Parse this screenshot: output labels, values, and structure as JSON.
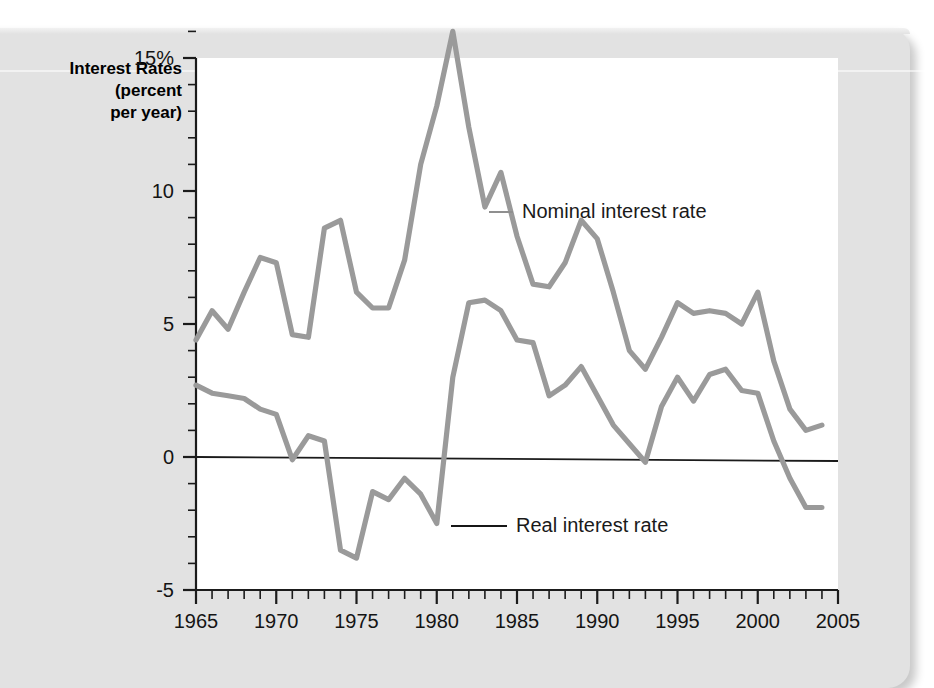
{
  "axis_title": "Interest Rates\n(percent\nper year)",
  "legend": {
    "nominal": "Nominal interest rate",
    "real": "Real interest rate"
  },
  "colors": {
    "series": "#9a9a9a",
    "axis": "#1b1b1b",
    "page": "#e2e2e2",
    "plot_background": "#ffffff"
  },
  "chart_data": {
    "type": "line",
    "title": "Interest Rates (percent per year)",
    "xlabel": "",
    "ylabel": "Interest Rates (percent per year)",
    "xlim": [
      1965,
      2005
    ],
    "ylim": [
      -5,
      16.5
    ],
    "grid": false,
    "legend_position": "inline-annotation",
    "x_tick_labels": [
      "1965",
      "1970",
      "1975",
      "1980",
      "1985",
      "1990",
      "1995",
      "2000",
      "2005"
    ],
    "x_major_ticks": [
      1965,
      1970,
      1975,
      1980,
      1985,
      1990,
      1995,
      2000,
      2005
    ],
    "x_minor_step": 1,
    "y_tick_labels": [
      "15%",
      "10",
      "5",
      "0",
      "-5"
    ],
    "y_major_ticks": [
      15,
      10,
      5,
      0,
      -5
    ],
    "y_minor_step": 1,
    "zero_line": 0,
    "x": [
      1965,
      1966,
      1967,
      1968,
      1969,
      1970,
      1971,
      1972,
      1973,
      1974,
      1975,
      1976,
      1977,
      1978,
      1979,
      1980,
      1981,
      1982,
      1983,
      1984,
      1985,
      1986,
      1987,
      1988,
      1989,
      1990,
      1991,
      1992,
      1993,
      1994,
      1995,
      1996,
      1997,
      1998,
      1999,
      2000,
      2001,
      2002,
      2003,
      2004
    ],
    "series": [
      {
        "name": "Nominal interest rate",
        "color": "#9a9a9a",
        "values": [
          4.4,
          5.5,
          4.8,
          6.2,
          7.5,
          7.3,
          4.6,
          4.5,
          8.6,
          8.9,
          6.2,
          5.6,
          5.6,
          7.4,
          11.0,
          13.2,
          16.0,
          12.4,
          9.4,
          10.7,
          8.3,
          6.5,
          6.4,
          7.3,
          8.9,
          8.2,
          6.2,
          4.0,
          3.3,
          4.5,
          5.8,
          5.4,
          5.5,
          5.4,
          5.0,
          6.2,
          3.6,
          1.8,
          1.0,
          1.2
        ]
      },
      {
        "name": "Real interest rate",
        "color": "#9a9a9a",
        "values": [
          2.7,
          2.4,
          2.3,
          2.2,
          1.8,
          1.6,
          -0.1,
          0.8,
          0.6,
          -3.5,
          -3.8,
          -1.3,
          -1.6,
          -0.8,
          -1.4,
          -2.5,
          3.0,
          5.8,
          5.9,
          5.5,
          4.4,
          4.3,
          2.3,
          2.7,
          3.4,
          2.3,
          1.2,
          0.5,
          -0.2,
          1.9,
          3.0,
          2.1,
          3.1,
          3.3,
          2.5,
          2.4,
          0.6,
          -0.8,
          -1.9,
          -1.9
        ]
      }
    ]
  }
}
